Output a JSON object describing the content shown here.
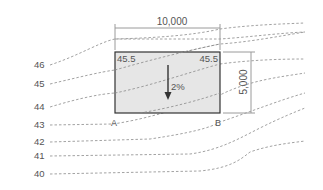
{
  "diagram": {
    "width_label": "10,000",
    "height_label": "5,000",
    "corner_elevations": {
      "top_left": "45.5",
      "top_right": "45.5"
    },
    "slope_label": "2%",
    "point_labels": {
      "left": "A",
      "right": "B"
    },
    "contours": [
      {
        "label": "46",
        "y": 65
      },
      {
        "label": "45",
        "y": 84
      },
      {
        "label": "44",
        "y": 107
      },
      {
        "label": "43",
        "y": 125
      },
      {
        "label": "42",
        "y": 142
      },
      {
        "label": "41",
        "y": 156
      },
      {
        "label": "40",
        "y": 174
      }
    ],
    "colors": {
      "plot_fill": "#e6e6e6",
      "plot_border": "#333333",
      "contour": "#8a8a8a",
      "dimension": "#9a9a9a",
      "text": "#555555"
    }
  }
}
